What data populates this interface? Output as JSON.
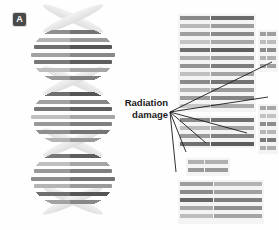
{
  "figure": {
    "background": "#ffffff",
    "panels": [
      {
        "id": "A",
        "badge_label": "A",
        "caption": "intact DNA double helix"
      },
      {
        "id": "B",
        "badge_label": "B",
        "caption": "fragmented DNA strands"
      }
    ]
  },
  "annotation": {
    "line1": "Radiation",
    "line2": "damage",
    "color": "#1a1a1a",
    "leader_color": "#1a1a1a",
    "origin": {
      "x": 170,
      "y": 112
    },
    "targets": [
      {
        "x": 272,
        "y": 62
      },
      {
        "x": 268,
        "y": 97
      },
      {
        "x": 247,
        "y": 133
      },
      {
        "x": 206,
        "y": 143
      },
      {
        "x": 186,
        "y": 152
      },
      {
        "x": 176,
        "y": 172
      }
    ]
  },
  "panel_a": {
    "badge": "A",
    "helix": {
      "lobes": [
        {
          "top": 26,
          "height": 58
        },
        {
          "top": 88,
          "height": 58
        },
        {
          "top": 150,
          "height": 58
        }
      ],
      "crossovers": [
        {
          "top": 14
        },
        {
          "top": 76
        },
        {
          "top": 138
        },
        {
          "top": 196
        }
      ],
      "rung_shades": [
        "#8e8e8e",
        "#b4b4b4",
        "#6f6f6f",
        "#a2a2a2",
        "#787878",
        "#c0c0c0",
        "#999999"
      ],
      "backbone_color": "#e9e9e9"
    }
  },
  "panel_b": {
    "badge": "B",
    "plate_color": "#f4f4f4",
    "fragments": [
      {
        "name": "fragment-top-left",
        "left": 32,
        "top": 14,
        "width": 78,
        "height": 98,
        "bars": [
          {
            "top": 2,
            "left_shade": "#8a8a8a",
            "right_shade": "#6b6b6b"
          },
          {
            "top": 10,
            "left_shade": "#b8b8b8",
            "right_shade": "#9e9e9e"
          },
          {
            "top": 18,
            "left_shade": "#a0a0a0",
            "right_shade": "#8a8a8a"
          },
          {
            "top": 26,
            "left_shade": "#c4c4c4",
            "right_shade": "#a8a8a8"
          },
          {
            "top": 34,
            "left_shade": "#6e6e6e",
            "right_shade": "#5f5f5f"
          },
          {
            "top": 42,
            "left_shade": "#b0b0b0",
            "right_shade": "#9a9a9a"
          },
          {
            "top": 50,
            "left_shade": "#949494",
            "right_shade": "#7d7d7d"
          },
          {
            "top": 58,
            "left_shade": "#c0c0c0",
            "right_shade": "#a4a4a4"
          },
          {
            "top": 66,
            "left_shade": "#8a8a8a",
            "right_shade": "#737373"
          },
          {
            "top": 74,
            "left_shade": "#b4b4b4",
            "right_shade": "#9a9a9a"
          },
          {
            "top": 82,
            "left_shade": "#9c9c9c",
            "right_shade": "#858585"
          },
          {
            "top": 90,
            "left_shade": "#c8c8c8",
            "right_shade": "#ababab"
          }
        ]
      },
      {
        "name": "fragment-top-right",
        "left": 112,
        "top": 30,
        "width": 20,
        "height": 42,
        "bars": [
          {
            "top": 2,
            "left_shade": "#9e9e9e",
            "right_shade": "#9e9e9e"
          },
          {
            "top": 10,
            "left_shade": "#bcbcbc",
            "right_shade": "#bcbcbc"
          },
          {
            "top": 18,
            "left_shade": "#8c8c8c",
            "right_shade": "#8c8c8c"
          },
          {
            "top": 26,
            "left_shade": "#b2b2b2",
            "right_shade": "#b2b2b2"
          },
          {
            "top": 34,
            "left_shade": "#a0a0a0",
            "right_shade": "#a0a0a0"
          }
        ]
      },
      {
        "name": "fragment-mid-left",
        "left": 32,
        "top": 116,
        "width": 78,
        "height": 32,
        "bars": [
          {
            "top": 2,
            "left_shade": "#8a8a8a",
            "right_shade": "#6f6f6f"
          },
          {
            "top": 10,
            "left_shade": "#bdbdbd",
            "right_shade": "#a2a2a2"
          },
          {
            "top": 18,
            "left_shade": "#9a9a9a",
            "right_shade": "#828282"
          },
          {
            "top": 26,
            "left_shade": "#707070",
            "right_shade": "#5d5d5d"
          }
        ]
      },
      {
        "name": "fragment-mid-right",
        "left": 112,
        "top": 104,
        "width": 20,
        "height": 50,
        "bars": [
          {
            "top": 2,
            "left_shade": "#a6a6a6",
            "right_shade": "#a6a6a6"
          },
          {
            "top": 10,
            "left_shade": "#c2c2c2",
            "right_shade": "#c2c2c2"
          },
          {
            "top": 18,
            "left_shade": "#8e8e8e",
            "right_shade": "#8e8e8e"
          },
          {
            "top": 26,
            "left_shade": "#b6b6b6",
            "right_shade": "#b6b6b6"
          },
          {
            "top": 34,
            "left_shade": "#7a7a7a",
            "right_shade": "#7a7a7a"
          },
          {
            "top": 42,
            "left_shade": "#aeaeae",
            "right_shade": "#aeaeae"
          }
        ]
      },
      {
        "name": "fragment-lower-short",
        "left": 40,
        "top": 158,
        "width": 44,
        "height": 18,
        "bars": [
          {
            "top": 2,
            "left_shade": "#b0b0b0",
            "right_shade": "#b0b0b0"
          },
          {
            "top": 10,
            "left_shade": "#9a9a9a",
            "right_shade": "#9a9a9a"
          }
        ]
      },
      {
        "name": "fragment-bottom",
        "left": 32,
        "top": 180,
        "width": 86,
        "height": 44,
        "bars": [
          {
            "top": 2,
            "left_shade": "#9e9e9e",
            "right_shade": "#b4b4b4"
          },
          {
            "top": 10,
            "left_shade": "#8a8a8a",
            "right_shade": "#a0a0a0"
          },
          {
            "top": 18,
            "left_shade": "#666666",
            "right_shade": "#7e7e7e"
          },
          {
            "top": 26,
            "left_shade": "#a8a8a8",
            "right_shade": "#8e8e8e"
          },
          {
            "top": 34,
            "left_shade": "#bdbdbd",
            "right_shade": "#a4a4a4"
          }
        ]
      }
    ]
  }
}
